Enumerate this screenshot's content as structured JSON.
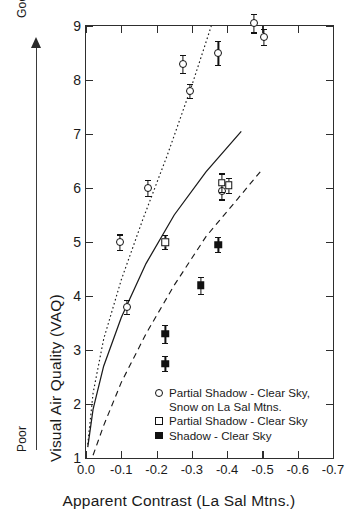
{
  "chart_data": {
    "type": "scatter",
    "title": "",
    "xlabel": "Apparent Contrast (La Sal Mtns.)",
    "ylabel": "Visual Air Quality (VAQ)",
    "xlim": [
      0.0,
      -0.7
    ],
    "ylim": [
      1,
      9
    ],
    "x_ticks": [
      "0.0",
      "-0.1",
      "-0.2",
      "-0.3",
      "-0.4",
      "-0.5",
      "-0.6",
      "-0.7"
    ],
    "x_tick_values": [
      0.0,
      -0.1,
      -0.2,
      -0.3,
      -0.4,
      -0.5,
      -0.6,
      -0.7
    ],
    "y_ticks": [
      "1",
      "2",
      "3",
      "4",
      "5",
      "6",
      "7",
      "8",
      "9"
    ],
    "y_tick_values": [
      1,
      2,
      3,
      4,
      5,
      6,
      7,
      8,
      9
    ],
    "grid": false,
    "legend_position": "inside-lower-right",
    "axis_direction_note": {
      "low_label": "Poor",
      "high_label": "Good",
      "arrow": "upward"
    },
    "series": [
      {
        "name": "Partial Shadow - Clear Sky, Snow on La Sal Mtns.",
        "marker": "open-circle",
        "fit_line_style": "dotted",
        "points": [
          {
            "x": -0.095,
            "y": 5.0,
            "yerr": 0.14
          },
          {
            "x": -0.115,
            "y": 3.8,
            "yerr": 0.13
          },
          {
            "x": -0.175,
            "y": 6.0,
            "yerr": 0.15
          },
          {
            "x": -0.275,
            "y": 8.3,
            "yerr": 0.17
          },
          {
            "x": -0.295,
            "y": 7.8,
            "yerr": 0.13
          },
          {
            "x": -0.375,
            "y": 8.5,
            "yerr": 0.22
          },
          {
            "x": -0.385,
            "y": 5.95,
            "yerr": 0.16
          },
          {
            "x": -0.475,
            "y": 9.05,
            "yerr": 0.17
          },
          {
            "x": -0.505,
            "y": 8.8,
            "yerr": 0.15
          }
        ]
      },
      {
        "name": "Partial Shadow - Clear Sky",
        "marker": "open-square",
        "fit_line_style": "solid",
        "points": [
          {
            "x": -0.225,
            "y": 5.0,
            "yerr": 0.13
          },
          {
            "x": -0.385,
            "y": 6.1,
            "yerr": 0.17
          },
          {
            "x": -0.405,
            "y": 6.05,
            "yerr": 0.14
          }
        ]
      },
      {
        "name": "Shadow - Clear Sky",
        "marker": "filled-square",
        "fit_line_style": "dashed",
        "points": [
          {
            "x": -0.225,
            "y": 2.75,
            "yerr": 0.14
          },
          {
            "x": -0.225,
            "y": 3.3,
            "yerr": 0.17
          },
          {
            "x": -0.325,
            "y": 4.2,
            "yerr": 0.16
          },
          {
            "x": -0.375,
            "y": 4.95,
            "yerr": 0.14
          }
        ]
      }
    ],
    "fit_curves": [
      {
        "name": "dotted-fit-partial-shadow-snow",
        "style": "dotted",
        "description": "steepest curve, from origin region rising to VAQ 9 near x=-0.36",
        "anchors": [
          [
            -0.005,
            1.25
          ],
          [
            -0.02,
            2.2
          ],
          [
            -0.05,
            3.2
          ],
          [
            -0.1,
            4.3
          ],
          [
            -0.16,
            5.4
          ],
          [
            -0.23,
            6.6
          ],
          [
            -0.3,
            7.9
          ],
          [
            -0.355,
            9.0
          ]
        ]
      },
      {
        "name": "solid-fit-partial-shadow",
        "style": "solid",
        "description": "middle curve rising to VAQ ~7 near x=-0.44",
        "anchors": [
          [
            -0.005,
            1.2
          ],
          [
            -0.02,
            1.9
          ],
          [
            -0.05,
            2.7
          ],
          [
            -0.1,
            3.6
          ],
          [
            -0.17,
            4.6
          ],
          [
            -0.25,
            5.5
          ],
          [
            -0.34,
            6.3
          ],
          [
            -0.44,
            7.05
          ]
        ]
      },
      {
        "name": "dashed-fit-shadow",
        "style": "dashed",
        "description": "shallowest curve rising to VAQ ~6.4 near x=-0.50",
        "anchors": [
          [
            -0.02,
            1.05
          ],
          [
            -0.05,
            1.6
          ],
          [
            -0.1,
            2.4
          ],
          [
            -0.17,
            3.3
          ],
          [
            -0.25,
            4.2
          ],
          [
            -0.34,
            5.1
          ],
          [
            -0.43,
            5.8
          ],
          [
            -0.5,
            6.35
          ]
        ]
      }
    ]
  },
  "axis": {
    "y_title": "Visual Air Quality (VAQ)",
    "x_title": "Apparent Contrast (La Sal Mtns.)",
    "good_label": "Good",
    "poor_label": "Poor"
  },
  "legend": {
    "entries": [
      {
        "symbol": "open-circle",
        "line1": "Partial Shadow - Clear Sky,",
        "line2": "Snow on La Sal Mtns."
      },
      {
        "symbol": "open-square",
        "line1": "Partial Shadow - Clear Sky",
        "line2": ""
      },
      {
        "symbol": "filled-square",
        "line1": "Shadow - Clear Sky",
        "line2": ""
      }
    ]
  }
}
